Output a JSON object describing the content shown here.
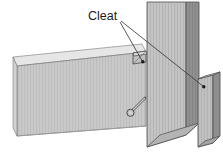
{
  "figure": {
    "background_color": "#ffffff",
    "width": 223,
    "height": 152
  },
  "annotations": {
    "cleat_label": "Cleat",
    "label_position": {
      "x": 88,
      "y": 19
    },
    "leader_lines": [
      {
        "name": "leader-to-upper-cleat",
        "from": {
          "x": 120,
          "y": 22
        },
        "to": {
          "x": 143,
          "y": 62
        },
        "endpoint_marker": "dot"
      },
      {
        "name": "leader-to-side-cleat",
        "from": {
          "x": 121,
          "y": 21
        },
        "to": {
          "x": 204,
          "y": 87
        },
        "endpoint_marker": "dot"
      }
    ]
  },
  "parts": {
    "beam": {
      "name": "beam",
      "front_face_color": "#c9c9c9",
      "top_face_color": "#e3e3e3",
      "edge_color": "#6e6e6e",
      "has_vertical_hatching": true
    },
    "column": {
      "name": "column",
      "front_face_color": "#c4c4c4",
      "side_face_color": "#8f8f8f",
      "bottom_face_color": "#b0b0b0",
      "edge_color": "#5a5a5a",
      "has_vertical_hatching": true
    },
    "upper_cleat": {
      "name": "upper-cleat",
      "face_color": "#b8b8b8",
      "edge_color": "#4f4f4f"
    },
    "side_cleat": {
      "name": "side-cleat",
      "front_face_color": "#c0c0c0",
      "side_face_color": "#8c8c8c",
      "top_face_color": "#e0e0e0",
      "edge_color": "#585858"
    },
    "bolt": {
      "name": "bolt-fastener",
      "head_color": "#b5b5b5",
      "shaft_color": "#a8a8a8",
      "outline_color": "#555555"
    }
  },
  "colors": {
    "line": "#3a3a3a",
    "text": "#1a1a1a",
    "white": "#ffffff"
  }
}
